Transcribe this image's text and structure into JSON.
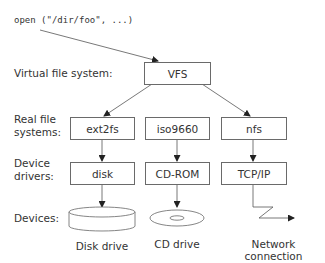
{
  "call": "open (\"/dir/foo\", ...)",
  "layers": {
    "vfs_label": "Virtual file system:",
    "real_fs_label_1": "Real file",
    "real_fs_label_2": "systems:",
    "drivers_label_1": "Device",
    "drivers_label_2": "drivers:",
    "devices_label": "Devices:"
  },
  "nodes": {
    "vfs": "VFS",
    "ext2fs": "ext2fs",
    "iso9660": "iso9660",
    "nfs": "nfs",
    "disk": "disk",
    "cdrom": "CD-ROM",
    "tcpip": "TCP/IP"
  },
  "devices": {
    "disk_drive": "Disk drive",
    "cd_drive": "CD drive",
    "network": "Network connection"
  },
  "colors": {
    "line": "#555555",
    "box_border": "#6a6a6a",
    "text": "#333333"
  }
}
